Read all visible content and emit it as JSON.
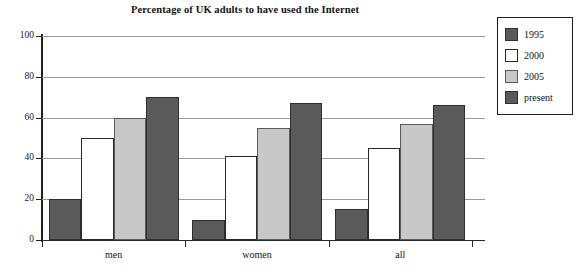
{
  "chart_data": {
    "type": "bar",
    "title": "Percentage of UK adults to have used the Internet",
    "xlabel": "",
    "ylabel": "",
    "ylim": [
      0,
      100
    ],
    "yticks": [
      0,
      20,
      40,
      60,
      80,
      100
    ],
    "ytick_labels": [
      "0",
      "20",
      "40",
      "60",
      "80",
      "100"
    ],
    "categories": [
      "men",
      "women",
      "all"
    ],
    "grid": true,
    "legend_position": "right",
    "series": [
      {
        "name": "1995",
        "color": "#5a5a5a",
        "values": [
          20,
          10,
          15
        ]
      },
      {
        "name": "2000",
        "color": "#ffffff",
        "values": [
          50,
          41,
          45
        ]
      },
      {
        "name": "2005",
        "color": "#c8c8c8",
        "values": [
          60,
          55,
          57
        ]
      },
      {
        "name": "present",
        "color": "#5a5a5a",
        "values": [
          70,
          67,
          66
        ]
      }
    ]
  },
  "legend": {
    "items": [
      {
        "label": "1995",
        "swatch": "dark"
      },
      {
        "label": "2000",
        "swatch": "white"
      },
      {
        "label": "2005",
        "swatch": "light"
      },
      {
        "label": "present",
        "swatch": "dark"
      }
    ]
  },
  "axes": {
    "y_tick_labels": [
      "100",
      "80",
      "60",
      "40",
      "20",
      "0"
    ],
    "x_tick_labels": [
      "men",
      "women",
      "all"
    ]
  }
}
